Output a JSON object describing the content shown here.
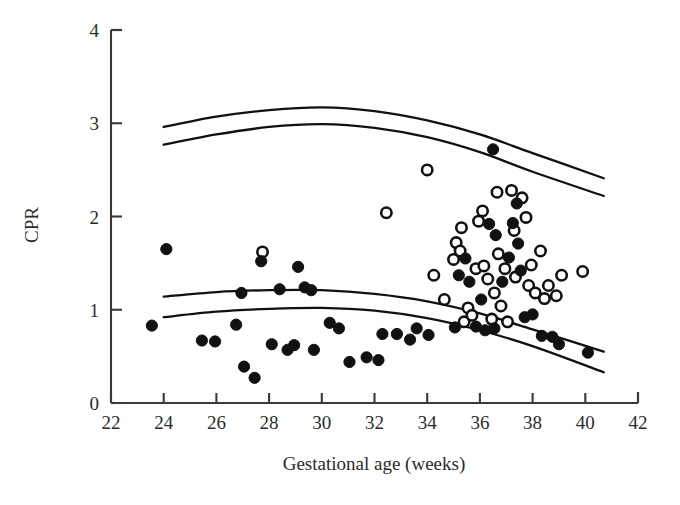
{
  "chart_data": {
    "type": "scatter",
    "title": "",
    "xlabel": "Gestational age (weeks)",
    "ylabel": "CPR",
    "xlim": [
      22,
      42
    ],
    "ylim": [
      0,
      4
    ],
    "xticks": [
      22,
      24,
      26,
      28,
      30,
      32,
      34,
      36,
      38,
      40,
      42
    ],
    "xtick_labels": [
      "22",
      "24",
      "26",
      "28",
      "30",
      "32",
      "34",
      "36",
      "38",
      "40",
      "42"
    ],
    "yticks": [
      0,
      1,
      2,
      3,
      4
    ],
    "ytick_labels": [
      "0",
      "1",
      "2",
      "3",
      "4"
    ],
    "grid": false,
    "legend": false,
    "series": [
      {
        "name": "filled-circles",
        "marker": "filled circle",
        "color": "#111111",
        "points": [
          [
            23.55,
            0.83
          ],
          [
            24.1,
            1.65
          ],
          [
            25.45,
            0.67
          ],
          [
            25.95,
            0.66
          ],
          [
            26.95,
            1.18
          ],
          [
            26.75,
            0.84
          ],
          [
            27.05,
            0.39
          ],
          [
            27.45,
            0.27
          ],
          [
            27.7,
            1.52
          ],
          [
            28.1,
            0.63
          ],
          [
            28.4,
            1.22
          ],
          [
            28.7,
            0.57
          ],
          [
            28.95,
            0.62
          ],
          [
            29.1,
            1.46
          ],
          [
            29.35,
            1.24
          ],
          [
            29.6,
            1.21
          ],
          [
            29.7,
            0.57
          ],
          [
            30.3,
            0.86
          ],
          [
            30.65,
            0.8
          ],
          [
            31.05,
            0.44
          ],
          [
            31.7,
            0.49
          ],
          [
            32.15,
            0.46
          ],
          [
            32.3,
            0.74
          ],
          [
            32.85,
            0.74
          ],
          [
            33.35,
            0.68
          ],
          [
            33.6,
            0.8
          ],
          [
            34.05,
            0.73
          ],
          [
            35.05,
            0.81
          ],
          [
            35.2,
            1.37
          ],
          [
            35.45,
            1.55
          ],
          [
            35.6,
            1.3
          ],
          [
            35.85,
            0.82
          ],
          [
            36.05,
            1.11
          ],
          [
            36.2,
            0.78
          ],
          [
            36.35,
            1.92
          ],
          [
            36.5,
            2.72
          ],
          [
            36.55,
            0.8
          ],
          [
            36.6,
            1.8
          ],
          [
            36.85,
            1.3
          ],
          [
            37.1,
            1.56
          ],
          [
            37.25,
            1.93
          ],
          [
            37.4,
            2.14
          ],
          [
            37.45,
            1.71
          ],
          [
            37.55,
            1.42
          ],
          [
            37.7,
            0.92
          ],
          [
            38.0,
            0.95
          ],
          [
            38.35,
            0.72
          ],
          [
            38.75,
            0.71
          ],
          [
            39.0,
            0.63
          ],
          [
            40.1,
            0.54
          ]
        ]
      },
      {
        "name": "open-circles",
        "marker": "open circle",
        "color": "#ffffff",
        "points": [
          [
            27.75,
            1.62
          ],
          [
            32.45,
            2.04
          ],
          [
            34.0,
            2.5
          ],
          [
            34.25,
            1.37
          ],
          [
            34.65,
            1.11
          ],
          [
            35.0,
            1.54
          ],
          [
            35.1,
            1.72
          ],
          [
            35.25,
            1.63
          ],
          [
            35.3,
            1.88
          ],
          [
            35.4,
            0.87
          ],
          [
            35.55,
            1.02
          ],
          [
            35.7,
            0.94
          ],
          [
            35.85,
            1.44
          ],
          [
            35.95,
            1.95
          ],
          [
            36.1,
            2.06
          ],
          [
            36.15,
            1.47
          ],
          [
            36.3,
            1.33
          ],
          [
            36.45,
            0.9
          ],
          [
            36.55,
            1.18
          ],
          [
            36.65,
            2.26
          ],
          [
            36.7,
            1.6
          ],
          [
            36.8,
            1.04
          ],
          [
            36.95,
            1.44
          ],
          [
            37.05,
            0.87
          ],
          [
            37.2,
            2.28
          ],
          [
            37.3,
            1.85
          ],
          [
            37.35,
            1.35
          ],
          [
            37.6,
            2.2
          ],
          [
            37.75,
            1.99
          ],
          [
            37.85,
            1.26
          ],
          [
            37.95,
            1.48
          ],
          [
            38.1,
            1.18
          ],
          [
            38.3,
            1.63
          ],
          [
            38.45,
            1.12
          ],
          [
            38.6,
            1.26
          ],
          [
            38.9,
            1.15
          ],
          [
            39.1,
            1.37
          ],
          [
            39.9,
            1.41
          ]
        ]
      }
    ],
    "reference_curves": [
      {
        "name": "upper-outer-centile",
        "points": [
          [
            24.0,
            2.96
          ],
          [
            26.0,
            3.07
          ],
          [
            28.0,
            3.14
          ],
          [
            30.0,
            3.17
          ],
          [
            32.0,
            3.13
          ],
          [
            34.0,
            3.03
          ],
          [
            36.0,
            2.88
          ],
          [
            38.0,
            2.68
          ],
          [
            40.7,
            2.41
          ]
        ]
      },
      {
        "name": "upper-inner-centile",
        "points": [
          [
            24.0,
            2.77
          ],
          [
            26.0,
            2.88
          ],
          [
            28.0,
            2.96
          ],
          [
            30.0,
            2.99
          ],
          [
            32.0,
            2.95
          ],
          [
            34.0,
            2.85
          ],
          [
            36.0,
            2.69
          ],
          [
            38.0,
            2.48
          ],
          [
            40.7,
            2.22
          ]
        ]
      },
      {
        "name": "lower-inner-centile",
        "points": [
          [
            24.0,
            1.14
          ],
          [
            26.0,
            1.19
          ],
          [
            28.0,
            1.21
          ],
          [
            30.0,
            1.21
          ],
          [
            32.0,
            1.17
          ],
          [
            34.0,
            1.09
          ],
          [
            36.0,
            0.96
          ],
          [
            38.0,
            0.79
          ],
          [
            40.7,
            0.55
          ]
        ]
      },
      {
        "name": "lower-outer-centile",
        "points": [
          [
            24.0,
            0.92
          ],
          [
            26.0,
            0.98
          ],
          [
            28.0,
            1.01
          ],
          [
            30.0,
            1.02
          ],
          [
            32.0,
            0.99
          ],
          [
            34.0,
            0.91
          ],
          [
            36.0,
            0.78
          ],
          [
            38.0,
            0.61
          ],
          [
            40.7,
            0.33
          ]
        ]
      }
    ]
  }
}
